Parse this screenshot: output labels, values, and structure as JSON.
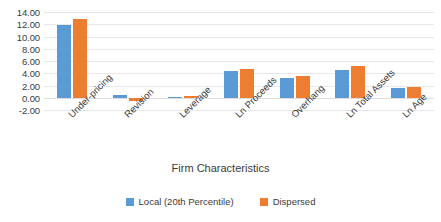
{
  "chart_data": {
    "type": "bar",
    "title": "",
    "subtitle": "",
    "xlabel": "Firm Characteristics",
    "ylabel": "",
    "ylim": [
      -2.0,
      14.0
    ],
    "ytick_step": 2.0,
    "ytick_labels": [
      "14.00",
      "12.00",
      "10.00",
      "8.00",
      "6.00",
      "4.00",
      "2.00",
      "0.00",
      "-2.00"
    ],
    "ytick_values": [
      14.0,
      12.0,
      10.0,
      8.0,
      6.0,
      4.0,
      2.0,
      0.0,
      -2.0
    ],
    "grid": true,
    "legend_position": "bottom",
    "categories": [
      "Under-pricing",
      "Revision",
      "Leverage",
      "Ln Proceeds",
      "Overhang",
      "Ln Total Assets",
      "Ln Age"
    ],
    "series": [
      {
        "name": "Local (20th Percentile)",
        "color": "#5B9BD5",
        "values": [
          11.8,
          0.5,
          0.2,
          4.3,
          3.2,
          4.6,
          1.6
        ]
      },
      {
        "name": "Dispersed",
        "color": "#ED7D31",
        "values": [
          12.8,
          -0.6,
          0.3,
          4.7,
          3.5,
          5.2,
          1.8
        ]
      }
    ]
  },
  "legend": {
    "items": [
      {
        "label": "Local (20th Percentile)",
        "color": "#5B9BD5"
      },
      {
        "label": "Dispersed",
        "color": "#ED7D31"
      }
    ]
  },
  "axis": {
    "x_title": "Firm Characteristics"
  },
  "colors": {
    "series_local": "#5B9BD5",
    "series_dispersed": "#ED7D31",
    "gridline": "#E8E8EC",
    "text": "#3B3B3B",
    "background": "#FFFFFF"
  }
}
